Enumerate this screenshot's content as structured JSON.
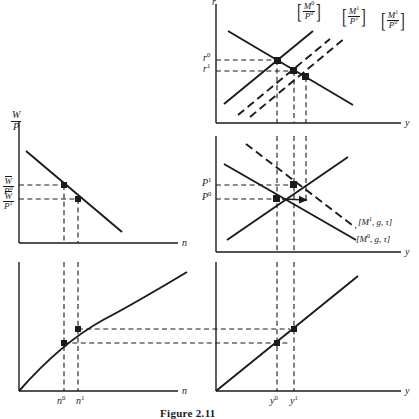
{
  "figure": {
    "caption": "Figure 2.11",
    "kind": "four-quadrant macroeconomic diagram",
    "ink_color": "#1a1a1a",
    "background": "#ffffff"
  },
  "panels": {
    "top_left": {
      "name": "labor-demand-panel",
      "y_axis_label": {
        "num": "W",
        "den": "P"
      },
      "x_axis_label": "n",
      "curve": "downward-sloping labor demand",
      "y_ticks": [
        {
          "num": "W",
          "num_bar": true,
          "den": "P",
          "den_sup": "0",
          "id": "wbar-p0"
        },
        {
          "num": "W",
          "num_bar": true,
          "den": "P",
          "den_sup": "1",
          "id": "wbar-p1"
        }
      ],
      "points": [
        "E0",
        "E1"
      ]
    },
    "bottom_left": {
      "name": "production-function-panel",
      "x_axis_label": "n",
      "curve": "concave production function y = f(n)",
      "x_ticks": [
        {
          "base": "n",
          "sup": "0"
        },
        {
          "base": "n",
          "sup": "1"
        }
      ],
      "points": [
        "A0",
        "A1"
      ]
    },
    "top_right": {
      "name": "is-lm-panel",
      "y_axis_label": "r",
      "x_axis_label": "y",
      "y_ticks": [
        {
          "base": "r",
          "sup": "0"
        },
        {
          "base": "r",
          "sup": "1"
        }
      ],
      "curve_labels": [
        {
          "id": "lm-m0-p0",
          "num": "M",
          "num_sup": "0",
          "den": "P",
          "den_sup": "0",
          "style": "solid"
        },
        {
          "id": "lm-m1-p1",
          "num": "M",
          "num_sup": "1",
          "den": "P",
          "den_sup": "1",
          "style": "dashed"
        },
        {
          "id": "lm-m1-p0",
          "num": "M",
          "num_sup": "1",
          "den": "P",
          "den_sup": "0",
          "style": "dashed"
        }
      ],
      "points": [
        "r0-y0",
        "r1-y-mid",
        "r1-y1"
      ]
    },
    "middle_right": {
      "name": "aggregate-demand-supply-panel",
      "x_axis_label": "y",
      "y_ticks": [
        {
          "base": "P",
          "sup": "1"
        },
        {
          "base": "P",
          "sup": "0"
        }
      ],
      "curve_labels": [
        {
          "id": "ad-m1",
          "text": "[M",
          "sup": "1",
          "rest": ", g, τ]",
          "style": "dashed"
        },
        {
          "id": "ad-m0",
          "text": "[M",
          "sup": "0",
          "rest": ", g, τ]",
          "style": "solid"
        }
      ],
      "points": [
        "P0-y0",
        "P1-y1"
      ]
    },
    "bottom_right": {
      "name": "forty-five-degree-panel",
      "x_axis_label": "y",
      "curve": "45 degree line",
      "x_ticks": [
        {
          "base": "y",
          "sup": "0"
        },
        {
          "base": "y",
          "sup": "1"
        }
      ],
      "points": [
        "B0",
        "B1"
      ]
    }
  }
}
